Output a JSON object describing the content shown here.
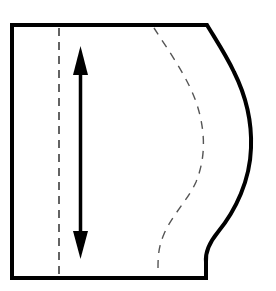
{
  "diagram": {
    "type": "sewing-pattern-piece",
    "colors": {
      "background": "#ffffff",
      "outline": "#000000",
      "dashed_fold_line": "#222222",
      "dashed_seam_line": "#555555",
      "grainline_arrow": "#000000"
    },
    "elements": {
      "outline": {
        "label": "pattern piece outline",
        "stroke_width": 4
      },
      "fold_line": {
        "label": "straight dashed line",
        "style": "dashed"
      },
      "seam_line": {
        "label": "curved dashed line",
        "style": "dashed"
      },
      "grainline": {
        "label": "double-headed grainline arrow"
      }
    }
  }
}
